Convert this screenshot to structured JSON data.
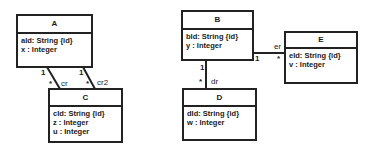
{
  "classes": {
    "A": {
      "name": "A",
      "attrs": [
        "aId: String {id}",
        "x : Integer"
      ]
    },
    "B": {
      "name": "B",
      "attrs": [
        "bId: String {id}",
        "y : Integer"
      ]
    },
    "C": {
      "name": "C",
      "attrs": [
        "cId: String {id}",
        "z : Integer",
        "u : Integer"
      ]
    },
    "D": {
      "name": "D",
      "attrs": [
        "dId: String {id}",
        "w : Integer"
      ]
    },
    "E": {
      "name": "E",
      "attrs": [
        "eId: String {id}",
        "v : Integer"
      ]
    }
  },
  "associations": [
    {
      "from": "A",
      "to": "C",
      "role": "cr",
      "from_mult": "1",
      "to_mult": "*"
    },
    {
      "from": "A",
      "to": "C",
      "role": "cr2",
      "from_mult": "1",
      "to_mult": "*"
    },
    {
      "from": "B",
      "to": "D",
      "role": "dr",
      "from_mult": "1",
      "to_mult": "*"
    },
    {
      "from": "B",
      "to": "E",
      "role": "er",
      "from_mult": "1",
      "to_mult": "*"
    }
  ]
}
